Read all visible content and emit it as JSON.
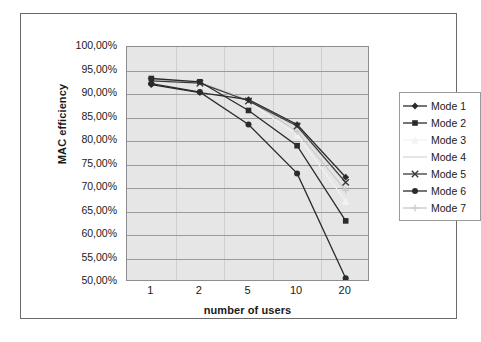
{
  "figure": {
    "background_color": "#ffffff",
    "frame_border_color": "#6a6a6a",
    "plot_background_color": "#e6e6e6",
    "gridline_color": "#9a9a9a"
  },
  "chart_data": {
    "type": "line",
    "title": "",
    "xlabel": "number of users",
    "ylabel": "MAC efficiency",
    "categories": [
      "1",
      "2",
      "5",
      "10",
      "20"
    ],
    "x": [
      1,
      2,
      5,
      10,
      20
    ],
    "ylim": [
      50,
      100
    ],
    "ytick_labels": [
      "100,00%",
      "95,00%",
      "90,00%",
      "85,00%",
      "80,00%",
      "75,00%",
      "70,00%",
      "65,00%",
      "60,00%",
      "55,00%",
      "50,00%"
    ],
    "ytick_values": [
      100,
      95,
      90,
      85,
      80,
      75,
      70,
      65,
      60,
      55,
      50
    ],
    "grid": true,
    "grid_axis": "y",
    "legend_position": "right",
    "series": [
      {
        "name": "Mode 1",
        "marker": "diamond",
        "color": "#2b2b2b",
        "values": [
          92.0,
          90.3,
          88.8,
          83.5,
          72.3
        ]
      },
      {
        "name": "Mode 2",
        "marker": "square",
        "color": "#2b2b2b",
        "values": [
          93.3,
          92.6,
          86.5,
          79.0,
          63.0
        ]
      },
      {
        "name": "Mode 3",
        "marker": "triangle",
        "color": "#f2f2f2",
        "values": [
          92.9,
          92.2,
          88.4,
          81.3,
          67.2
        ]
      },
      {
        "name": "Mode 4",
        "marker": "none",
        "color": "#d9d9d9",
        "values": [
          93.0,
          92.4,
          88.6,
          82.6,
          71.0
        ]
      },
      {
        "name": "Mode 5",
        "marker": "x",
        "color": "#3a3a3a",
        "values": [
          92.8,
          92.3,
          88.5,
          83.2,
          71.2
        ]
      },
      {
        "name": "Mode 6",
        "marker": "circle",
        "color": "#2b2b2b",
        "values": [
          92.2,
          90.4,
          83.5,
          73.1,
          50.8
        ]
      },
      {
        "name": "Mode 7",
        "marker": "plus",
        "color": "#c8c8c8",
        "values": [
          93.1,
          92.5,
          88.7,
          82.0,
          69.5
        ]
      }
    ]
  },
  "legend": {
    "items": [
      {
        "label": "Mode 1"
      },
      {
        "label": "Mode 2"
      },
      {
        "label": "Mode 3"
      },
      {
        "label": "Mode 4"
      },
      {
        "label": "Mode 5"
      },
      {
        "label": "Mode 6"
      },
      {
        "label": "Mode 7"
      }
    ]
  }
}
